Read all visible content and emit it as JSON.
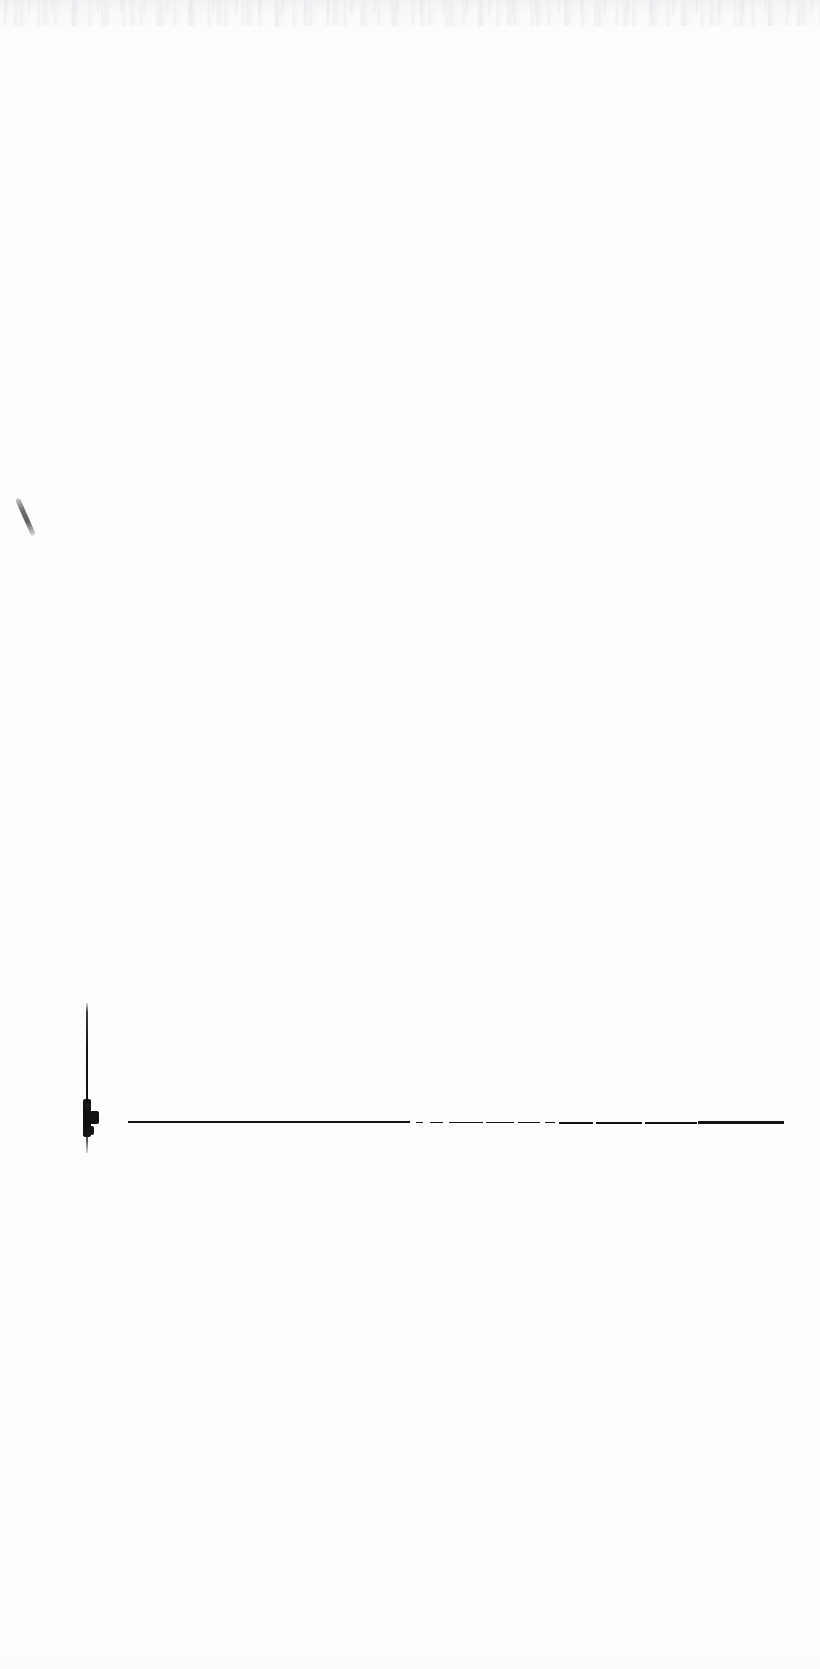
{
  "document": {
    "kind": "scanned-figure",
    "title": "",
    "caption": "",
    "background_color": "#fdfdfd",
    "ink_color": "#131313",
    "faint_ink_color": "#6c6c6c",
    "width_px": 820,
    "height_px": 1669
  },
  "marks": {
    "tick_mark": {
      "name": "diagonal-pen-tick",
      "x": 23,
      "y": 497,
      "length": 40,
      "rotation_deg": -24,
      "color": "#6c6c6c"
    },
    "vertical_axis": {
      "name": "vertical-axis-line",
      "x": 86,
      "y_top": 1003,
      "y_bottom": 1153,
      "thickness": 2.4,
      "color": "#141414"
    },
    "origin_blob": {
      "name": "origin-ink-blob",
      "x": 83,
      "y": 1099,
      "width": 16,
      "height": 38,
      "color": "#101010"
    },
    "baseline": {
      "name": "horizontal-baseline",
      "y": 1122,
      "x_start": 128,
      "x_end": 782,
      "color": "#131313"
    }
  },
  "chart_data": {
    "type": "line",
    "title": "",
    "subtitle": "",
    "xlabel": "",
    "ylabel": "",
    "grid": false,
    "legend": null,
    "annotations": [],
    "axis": {
      "y_axis_pixel_x": 86,
      "y_axis_pixel_top": 1003,
      "y_axis_pixel_bottom": 1153,
      "x_axis_pixel_y": 1122,
      "x_axis_pixel_start": 128,
      "x_axis_pixel_end": 782
    },
    "xticks": [],
    "yticks": [],
    "xlim": [
      0,
      100
    ],
    "ylim": [
      0,
      100
    ],
    "series": [
      {
        "name": "trace",
        "description": "flat baseline trace at zero amplitude with a single large spike at the left origin",
        "x": [
          0,
          1,
          2,
          4,
          6,
          10,
          15,
          20,
          25,
          30,
          35,
          40,
          45,
          50,
          55,
          60,
          65,
          70,
          75,
          80,
          85,
          90,
          95,
          100
        ],
        "values": [
          0,
          96,
          28,
          4,
          1,
          0,
          0,
          0,
          0,
          0,
          0,
          0,
          0,
          0,
          0,
          0,
          0,
          0,
          0,
          0,
          0,
          0,
          0,
          0
        ]
      }
    ],
    "segments": [
      {
        "x": 128,
        "y": 1121.0,
        "w": 86,
        "h": 1.6
      },
      {
        "x": 210,
        "y": 1120.6,
        "w": 78,
        "h": 2.0
      },
      {
        "x": 282,
        "y": 1120.9,
        "w": 64,
        "h": 2.3
      },
      {
        "x": 342,
        "y": 1121.2,
        "w": 50,
        "h": 1.8
      },
      {
        "x": 388,
        "y": 1121.4,
        "w": 22,
        "h": 1.5
      },
      {
        "x": 416,
        "y": 1121.6,
        "w": 7,
        "h": 1.4
      },
      {
        "x": 430,
        "y": 1121.6,
        "w": 13,
        "h": 1.5
      },
      {
        "x": 449,
        "y": 1121.7,
        "w": 34,
        "h": 1.7
      },
      {
        "x": 486,
        "y": 1121.8,
        "w": 28,
        "h": 1.6
      },
      {
        "x": 518,
        "y": 1121.9,
        "w": 22,
        "h": 1.5
      },
      {
        "x": 545,
        "y": 1121.9,
        "w": 10,
        "h": 1.4
      },
      {
        "x": 559,
        "y": 1121.8,
        "w": 34,
        "h": 2.1
      },
      {
        "x": 596,
        "y": 1121.7,
        "w": 46,
        "h": 2.4
      },
      {
        "x": 645,
        "y": 1121.6,
        "w": 52,
        "h": 2.6
      },
      {
        "x": 698,
        "y": 1121.2,
        "w": 44,
        "h": 3.1
      },
      {
        "x": 740,
        "y": 1120.9,
        "w": 44,
        "h": 2.9
      }
    ]
  }
}
